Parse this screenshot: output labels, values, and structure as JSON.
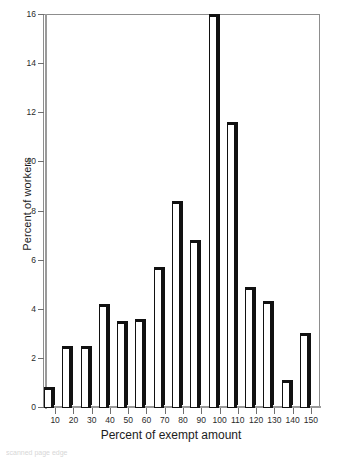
{
  "chart_data": {
    "type": "bar",
    "title": "",
    "subtitle": "",
    "xlabel": "Percent of exempt amount",
    "ylabel": "Percent of workers",
    "categories": [
      "10",
      "20",
      "30",
      "40",
      "50",
      "60",
      "70",
      "80",
      "90",
      "100",
      "110",
      "120",
      "130",
      "140",
      "150"
    ],
    "values": [
      0.8,
      2.5,
      2.5,
      4.2,
      3.5,
      3.6,
      5.7,
      8.4,
      6.8,
      16.0,
      11.6,
      4.9,
      4.3,
      1.1,
      3.0
    ],
    "xlim": [
      5,
      155
    ],
    "ylim": [
      0,
      16
    ],
    "yticks": [
      0,
      2,
      4,
      6,
      8,
      10,
      12,
      14,
      16
    ],
    "ytick_labels": [
      "0",
      "2",
      "4",
      "6",
      "8",
      "10",
      "12",
      "14",
      "16"
    ],
    "xticks": [
      10,
      20,
      30,
      40,
      50,
      60,
      70,
      80,
      90,
      100,
      110,
      120,
      130,
      140,
      150
    ],
    "xtick_labels": [
      "10",
      "20",
      "30",
      "40",
      "50",
      "60",
      "70",
      "80",
      "90",
      "100",
      "110",
      "120",
      "130",
      "140",
      "150"
    ],
    "grid": false,
    "legend": null,
    "bar_style": "white-fill-black-3d-shadow",
    "colors": {
      "bar_face": "#ffffff",
      "bar_edge": "#111111",
      "axis": "#8d8d8d",
      "text": "#1c1c1c",
      "background": "#ffffff"
    }
  },
  "artifact": {
    "footer_bleed": "scanned page edge"
  }
}
